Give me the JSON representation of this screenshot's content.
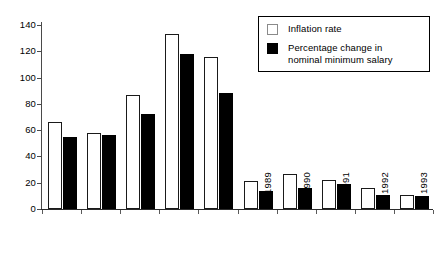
{
  "chart_data": {
    "type": "bar",
    "title": "",
    "subtitle": "",
    "xlabel": "",
    "ylabel": "",
    "ylim": [
      0,
      140
    ],
    "yticks": [
      0,
      20,
      40,
      60,
      80,
      100,
      120,
      140
    ],
    "ytick_labels": [
      "0",
      "20",
      "40",
      "60",
      "80",
      "100",
      "120",
      "140"
    ],
    "grid": false,
    "legend_position": "top-right",
    "categories": [
      "1984",
      "1985",
      "1986",
      "1987",
      "1988",
      "1989",
      "1990",
      "1991",
      "1992",
      "1993"
    ],
    "series": [
      {
        "name": "Inflation rate",
        "style": "white-filled-black-outline",
        "values": [
          66,
          58,
          87,
          133,
          116,
          21,
          27,
          22,
          16,
          11
        ]
      },
      {
        "name": "Percentage change in nominal minimum salary",
        "style": "solid-black",
        "values": [
          55,
          56,
          72,
          118,
          88,
          14,
          16,
          19,
          11,
          10
        ]
      }
    ]
  },
  "legend": {
    "items": [
      {
        "label": "Inflation rate",
        "swatch": "white-square-icon"
      },
      {
        "label": "Percentage change in\nnominal minimum salary",
        "swatch": "black-square-icon"
      }
    ]
  }
}
